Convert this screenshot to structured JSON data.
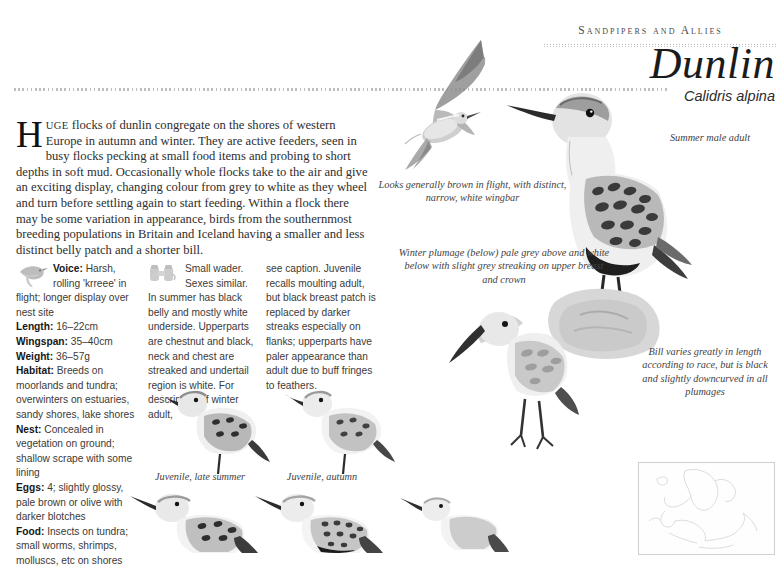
{
  "header": {
    "running_head": "Sandpipers and Allies",
    "species_name": "Dunlin",
    "scientific_name": "Calidris alpina"
  },
  "intro": {
    "dropcap": "H",
    "smallcaps": "UGE",
    "body": " flocks of dunlin congregate on the shores of western Europe in autumn and winter. They are active feeders, seen in busy flocks pecking at small food items and probing to short depths in soft mud. Occasionally whole flocks take to the air and give an exciting display, changing colour from grey to white as they wheel and turn before settling again to start feeding. Within a flock there may be some variation in appearance, birds from the southernmost breeding populations in Britain and Iceland having a smaller and less distinct belly patch and a shorter bill."
  },
  "facts": [
    {
      "label": "Voice:",
      "value": " Harsh, rolling 'krreee' in flight; longer display over nest site"
    },
    {
      "label": "Length:",
      "value": " 16–22cm"
    },
    {
      "label": "Wingspan:",
      "value": " 35–40cm"
    },
    {
      "label": "Weight:",
      "value": " 36–57g"
    },
    {
      "label": "Habitat:",
      "value": " Breeds on moorlands and tundra; overwinters on estuaries, sandy shores, lake shores"
    },
    {
      "label": "Nest:",
      "value": " Concealed in vegetation on ground; shallow scrape with some lining"
    },
    {
      "label": "Eggs:",
      "value": " 4; slightly glossy, pale brown or olive with darker blotches"
    },
    {
      "label": "Food:",
      "value": " Insects on tundra; small worms, shrimps, molluscs, etc on shores"
    }
  ],
  "description": {
    "column_one": "Small wader. Sexes similar. In summer has black belly and mostly white underside. Upperparts are chestnut and black, neck and chest are streaked and undertail region is white. For description of winter adult,",
    "column_two": "see caption. Juvenile recalls moulting adult, but black breast patch is replaced by darker streaks especially on flanks; upperparts have paler appearance than adult due to buff fringes to feathers."
  },
  "captions": {
    "flight": "Looks generally brown in flight, with distinct, narrow, white wingbar",
    "winter": "Winter plumage (below) pale grey above and white below with slight grey streaking on upper breast and crown",
    "summer_male": "Summer male adult",
    "bill": "Bill varies greatly in length according to race, but is black and slightly downcurved in all plumages",
    "juvenile_late_summer": "Juvenile, late summer",
    "juvenile_autumn": "Juvenile, autumn"
  },
  "icons": {
    "voice_icon": "bird-silhouette-icon",
    "description_icon": "binoculars-icon"
  },
  "colors": {
    "ink": "#2e2e2e",
    "rule": "#bdbdbd",
    "plumage_dark": "#4a4a4a",
    "plumage_light": "#d9d9d9"
  }
}
